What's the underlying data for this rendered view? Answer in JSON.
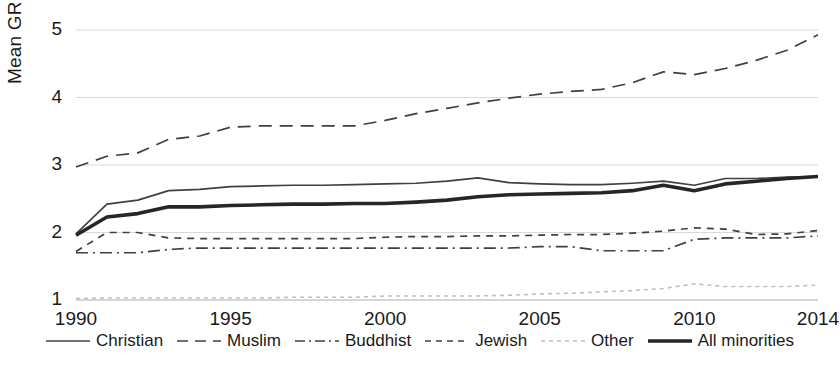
{
  "chart_data": {
    "type": "line",
    "title": "",
    "xlabel": "",
    "ylabel": "Mean GRD",
    "xlim": [
      1990,
      2014
    ],
    "ylim": [
      1,
      5
    ],
    "yticks": [
      1,
      2,
      3,
      4,
      5
    ],
    "xticks": [
      1990,
      1995,
      2000,
      2005,
      2010,
      2014
    ],
    "grid": true,
    "legend_position": "bottom",
    "x": [
      1990,
      1991,
      1992,
      1993,
      1994,
      1995,
      1996,
      1997,
      1998,
      1999,
      2000,
      2001,
      2002,
      2003,
      2004,
      2005,
      2006,
      2007,
      2008,
      2009,
      2010,
      2011,
      2012,
      2013,
      2014
    ],
    "series": [
      {
        "name": "Christian",
        "style": "solid",
        "color": "#404040",
        "values": [
          1.98,
          2.42,
          2.48,
          2.62,
          2.64,
          2.68,
          2.69,
          2.7,
          2.7,
          2.71,
          2.72,
          2.73,
          2.76,
          2.81,
          2.74,
          2.72,
          2.71,
          2.71,
          2.73,
          2.76,
          2.7,
          2.8,
          2.8,
          2.82,
          2.83
        ]
      },
      {
        "name": "Muslim",
        "style": "dashed",
        "color": "#404040",
        "values": [
          2.97,
          3.13,
          3.18,
          3.38,
          3.43,
          3.56,
          3.58,
          3.58,
          3.58,
          3.58,
          3.66,
          3.76,
          3.84,
          3.92,
          3.99,
          4.05,
          4.09,
          4.12,
          4.22,
          4.38,
          4.34,
          4.43,
          4.55,
          4.7,
          4.93
        ]
      },
      {
        "name": "Buddhist",
        "style": "dashdot",
        "color": "#404040",
        "values": [
          1.7,
          1.7,
          1.7,
          1.75,
          1.77,
          1.77,
          1.77,
          1.77,
          1.77,
          1.77,
          1.77,
          1.77,
          1.77,
          1.77,
          1.77,
          1.79,
          1.79,
          1.73,
          1.73,
          1.73,
          1.9,
          1.92,
          1.92,
          1.92,
          1.95
        ]
      },
      {
        "name": "Jewish",
        "style": "dashed-short",
        "color": "#404040",
        "values": [
          1.72,
          2.0,
          2.0,
          1.92,
          1.91,
          1.91,
          1.91,
          1.91,
          1.91,
          1.91,
          1.93,
          1.94,
          1.94,
          1.95,
          1.95,
          1.96,
          1.97,
          1.97,
          1.99,
          2.02,
          2.07,
          2.05,
          1.97,
          1.98,
          2.03
        ]
      },
      {
        "name": "Other",
        "style": "dotted-light",
        "color": "#bfbfbf",
        "values": [
          1.02,
          1.03,
          1.03,
          1.03,
          1.03,
          1.03,
          1.03,
          1.04,
          1.04,
          1.04,
          1.06,
          1.06,
          1.06,
          1.06,
          1.07,
          1.09,
          1.1,
          1.12,
          1.14,
          1.17,
          1.24,
          1.2,
          1.2,
          1.2,
          1.22
        ]
      },
      {
        "name": "All minorities",
        "style": "solid-thick",
        "color": "#262626",
        "values": [
          1.96,
          2.23,
          2.28,
          2.38,
          2.38,
          2.4,
          2.41,
          2.42,
          2.42,
          2.43,
          2.43,
          2.45,
          2.48,
          2.53,
          2.56,
          2.57,
          2.58,
          2.59,
          2.62,
          2.7,
          2.62,
          2.72,
          2.76,
          2.8,
          2.83
        ]
      }
    ]
  },
  "axis": {
    "ylabel": "Mean GRD",
    "yticks": [
      "1",
      "2",
      "3",
      "4",
      "5"
    ],
    "xticks": [
      "1990",
      "1995",
      "2000",
      "2005",
      "2010",
      "2014"
    ]
  },
  "legend": {
    "items": [
      {
        "label": "Christian"
      },
      {
        "label": "Muslim"
      },
      {
        "label": "Buddhist"
      },
      {
        "label": "Jewish"
      },
      {
        "label": "Other"
      },
      {
        "label": "All minorities"
      }
    ]
  }
}
